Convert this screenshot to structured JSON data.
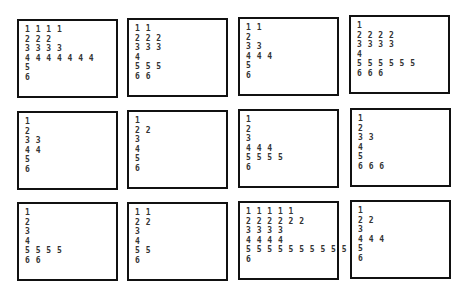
{
  "panels": [
    {
      "lines": [
        "1 1 1 1",
        "2 2 2",
        "3 3 3 3",
        "4 4 4 4 4 4 4",
        "5",
        "6"
      ]
    },
    {
      "lines": [
        "1 1",
        "2 2 2",
        "3 3 3",
        "4",
        "5 5 5",
        "6 6"
      ]
    },
    {
      "lines": [
        "1 1",
        "2",
        "3 3",
        "4 4 4",
        "5",
        "6"
      ]
    },
    {
      "lines": [
        "1",
        "2 2 2 2",
        "3 3 3 3",
        "4",
        "5 5 5 5 5 5",
        "6 6 6"
      ]
    },
    {
      "lines": [
        "1",
        "2",
        "3 3",
        "4 4",
        "5",
        "6"
      ]
    },
    {
      "lines": [
        "1",
        "2 2",
        "3",
        "4",
        "5",
        "6"
      ]
    },
    {
      "lines": [
        "1",
        "2",
        "3",
        "4 4 4",
        "5 5 5 5",
        "6"
      ]
    },
    {
      "lines": [
        "1",
        "2",
        "3 3",
        "4",
        "5",
        "6 6 6"
      ]
    },
    {
      "lines": [
        "1",
        "2",
        "3",
        "4",
        "5 5 5 5",
        "6 6"
      ]
    },
    {
      "lines": [
        "1 1",
        "2 2",
        "3",
        "4",
        "5 5",
        "6"
      ]
    },
    {
      "lines": [
        "1 1 1 1 1",
        "2 2 2 2 2 2",
        "3 3 3 3",
        "4 4 4 4",
        "5 5 5 5 5 5 5 5 5 5 5",
        "6"
      ]
    },
    {
      "lines": [
        "1",
        "2 2",
        "3",
        "4 4 4",
        "5",
        "6"
      ]
    }
  ]
}
